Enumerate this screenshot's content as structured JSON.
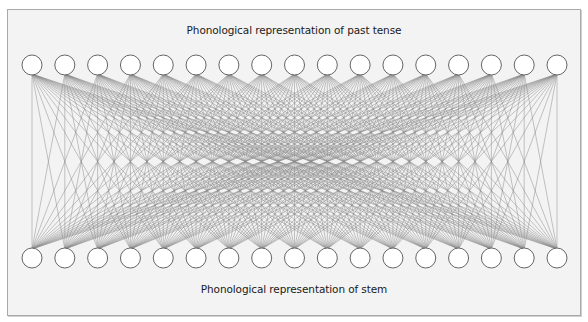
{
  "diagram": {
    "top_layer": {
      "label": "Phonological representation of past tense",
      "node_count": 17
    },
    "bottom_layer": {
      "label": "Phonological representation of stem",
      "node_count": 17
    },
    "connectivity": "fully-connected",
    "colors": {
      "background": "#f3f3f3",
      "border": "#a9a9a9",
      "node_fill": "#ffffff",
      "node_stroke": "#666666",
      "edge": "#8a8a8a",
      "text": "#1a1a1a"
    }
  }
}
